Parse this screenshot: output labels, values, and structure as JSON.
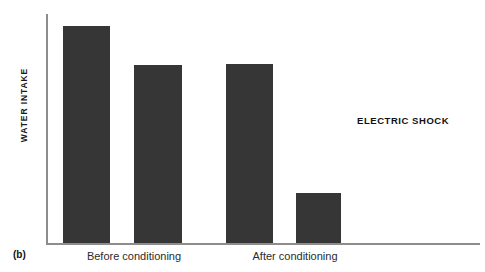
{
  "panel": {
    "label": "(b)"
  },
  "chart_data": {
    "type": "bar",
    "title": "",
    "subtitle": "",
    "xlabel": "",
    "ylabel": "WATER INTAKE",
    "categories": [
      "Before conditioning",
      "Before conditioning",
      "After conditioning",
      "After conditioning"
    ],
    "group_labels": [
      "Before conditioning",
      "After conditioning"
    ],
    "values": [
      217,
      178,
      179,
      50
    ],
    "values_note": "bar heights in pixels above the baseline; axis is unlabeled/unscaled",
    "ylim": [
      0,
      230
    ],
    "grid": false,
    "legend": null,
    "bar_color": "#363636",
    "axis_color": "#8d8d8d",
    "bars": [
      {
        "name": "bar-1",
        "group": "Before conditioning",
        "x": 63,
        "width": 47,
        "height": 217
      },
      {
        "name": "bar-2",
        "group": "Before conditioning",
        "x": 134,
        "width": 48,
        "height": 178
      },
      {
        "name": "bar-3",
        "group": "After conditioning",
        "x": 226,
        "width": 47,
        "height": 179
      },
      {
        "name": "bar-4",
        "group": "After conditioning",
        "x": 296,
        "width": 45,
        "height": 50
      }
    ],
    "annotations": [
      {
        "text": "ELECTRIC SHOCK",
        "x": 357,
        "y": 115
      }
    ]
  },
  "annotations": {
    "electric_shock": "ELECTRIC SHOCK"
  },
  "axis": {
    "x_tick_before": "Before conditioning",
    "x_tick_after": "After conditioning"
  }
}
